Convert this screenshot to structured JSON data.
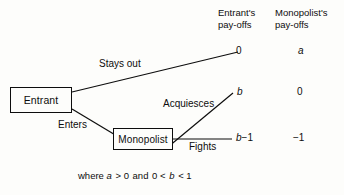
{
  "diagram": {
    "type": "game-tree",
    "title_visible": false,
    "background_color": "#fdfdfb",
    "line_color": "#0d0d0d",
    "nodes": [
      {
        "id": "entrant",
        "label": "Entrant"
      },
      {
        "id": "monopolist",
        "label": "Monopolist"
      }
    ],
    "branch_labels": {
      "stays_out": "Stays out",
      "enters": "Enters",
      "acquiesces": "Acquiesces",
      "fights": "Fights"
    },
    "columns": {
      "entrant_header_line1": "Entrant's",
      "entrant_header_line2": "pay-offs",
      "monopolist_header_line1": "Monopolist's",
      "monopolist_header_line2": "pay-offs"
    },
    "outcomes": [
      {
        "path": "Stays out",
        "entrant_payoff": "0",
        "monopolist_payoff": "a",
        "entrant_payoff_italic": false,
        "monopolist_payoff_italic": true
      },
      {
        "path": "Enters then Acquiesces",
        "entrant_payoff": "b",
        "monopolist_payoff": "0",
        "entrant_payoff_italic": true,
        "monopolist_payoff_italic": false
      },
      {
        "path": "Enters then Fights",
        "entrant_payoff": "b−1",
        "monopolist_payoff": "−1",
        "entrant_payoff_italic": true,
        "monopolist_payoff_italic": false
      }
    ],
    "payoff_values": {
      "e1": "0",
      "e2": "b",
      "e3_var": "b",
      "e3_rest": "−1",
      "m1": "a",
      "m2": "0",
      "m3": "−1"
    },
    "caption": {
      "prefix": "where ",
      "var_a": "a",
      "a_relation": " > 0",
      "conjunction": "  and  ",
      "lower_bound": "0 < ",
      "var_b": "b",
      "upper_bound": " < 1",
      "full_text": "where a > 0 and 0 < b < 1"
    }
  }
}
